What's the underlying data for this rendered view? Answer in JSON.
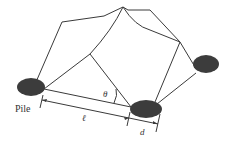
{
  "diagram": {
    "labels": {
      "pile": "Pile",
      "theta": "θ",
      "ell": "ℓ",
      "d": "d"
    },
    "colors": {
      "line": "#3a3a3a",
      "pile_fill": "#3c3c3c",
      "background": "#ffffff"
    }
  }
}
